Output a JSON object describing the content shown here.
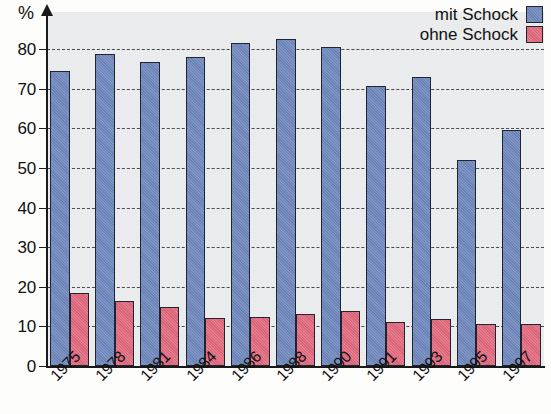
{
  "chart_data": {
    "type": "bar",
    "title": "",
    "subtitle": "",
    "xlabel": "",
    "ylabel": "%",
    "ylim": [
      0,
      85
    ],
    "y_ticks": [
      0,
      10,
      20,
      30,
      40,
      50,
      60,
      70,
      80
    ],
    "grid": true,
    "legend_position": "top-right",
    "categories": [
      "1975",
      "1978",
      "1981",
      "1984",
      "1986",
      "1988",
      "1990",
      "1991",
      "1993",
      "1995",
      "1997"
    ],
    "series": [
      {
        "name": "mit Schock",
        "color": "#7189bf",
        "values": [
          74.5,
          78.8,
          76.6,
          77.9,
          81.4,
          82.5,
          80.5,
          70.6,
          72.9,
          52.1,
          59.6
        ]
      },
      {
        "name": "ohne Schock",
        "color": "#e4697e",
        "values": [
          18.5,
          16.5,
          14.8,
          12.2,
          12.3,
          13.2,
          14.0,
          11.0,
          11.8,
          10.6,
          10.5
        ]
      }
    ]
  },
  "axis": {
    "y_title": "%",
    "y_tick_labels": [
      "80",
      "70",
      "60",
      "50",
      "40",
      "30",
      "20",
      "10",
      "0"
    ]
  },
  "legend": {
    "items": [
      {
        "label": "mit Schock",
        "color": "#7189bf"
      },
      {
        "label": "ohne Schock",
        "color": "#e4697e"
      }
    ]
  },
  "colors": {
    "series_blue": "#7189bf",
    "series_red": "#e4697e",
    "plot_background": "#eceef0",
    "axis": "#1a1a1a",
    "gridline": "#4a4a4a"
  }
}
